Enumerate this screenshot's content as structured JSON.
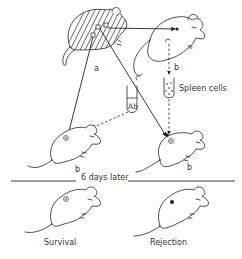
{
  "diagram": {
    "nodes": {
      "donor_mouse": {
        "strain_label": "a",
        "pattern": "hatched"
      },
      "spleen_donor_mouse": {
        "strain_label": "b"
      },
      "spleen_cells_tube": {
        "label": "Spleen cells"
      },
      "antibody_tube": {
        "label": "Ab"
      },
      "recipient_antibody": {
        "strain_label": "b"
      },
      "recipient_spleen": {
        "strain_label": "b"
      },
      "outcome_left": {
        "label": "Survival"
      },
      "outcome_right": {
        "label": "Rejection"
      }
    },
    "divider": {
      "label": "6 days later"
    },
    "edges": [
      {
        "from": "donor_mouse",
        "to": "spleen_donor_mouse",
        "style": "solid"
      },
      {
        "from": "donor_mouse",
        "to": "recipient_antibody",
        "style": "solid"
      },
      {
        "from": "donor_mouse",
        "to": "recipient_spleen",
        "style": "solid"
      },
      {
        "from": "spleen_donor_mouse",
        "to": "spleen_cells_tube",
        "style": "dashed"
      },
      {
        "from": "spleen_donor_mouse",
        "to": "antibody_tube",
        "style": "solid"
      },
      {
        "from": "antibody_tube",
        "to": "recipient_antibody",
        "style": "dashed"
      },
      {
        "from": "spleen_cells_tube",
        "to": "recipient_spleen",
        "style": "dashed"
      }
    ],
    "colors": {
      "ink": "#222222",
      "background": "#ffffff"
    }
  }
}
